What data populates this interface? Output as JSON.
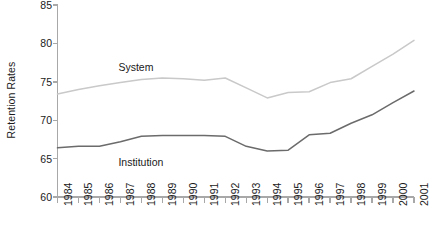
{
  "chart_data": {
    "type": "line",
    "title": "",
    "xlabel": "",
    "ylabel": "Retention Rates",
    "ylim": [
      60,
      85
    ],
    "yticks": [
      60,
      65,
      70,
      75,
      80,
      85
    ],
    "grid": false,
    "legend_position": "inline-labels",
    "categories": [
      "1984",
      "1985",
      "1986",
      "1987",
      "1988",
      "1989",
      "1990",
      "1991",
      "1992",
      "1993",
      "1994",
      "1995",
      "1996",
      "1997",
      "1998",
      "1999",
      "2000",
      "2001"
    ],
    "series": [
      {
        "name": "System",
        "color": "#c9c9c9",
        "values": [
          73.4,
          74.0,
          74.5,
          74.9,
          75.3,
          75.5,
          75.4,
          75.2,
          75.5,
          74.2,
          72.9,
          73.6,
          73.7,
          74.9,
          75.4,
          77.0,
          78.6,
          80.4
        ]
      },
      {
        "name": "Institution",
        "color": "#6b6b6b",
        "values": [
          66.4,
          66.6,
          66.6,
          67.2,
          67.9,
          68.0,
          68.0,
          68.0,
          67.9,
          66.6,
          66.0,
          66.1,
          68.1,
          68.3,
          69.6,
          70.7,
          72.3,
          73.8
        ]
      }
    ],
    "series_label_annotations": [
      {
        "text": "System",
        "x_category": "1987",
        "y_value": 76.8
      },
      {
        "text": "Institution",
        "x_category": "1987",
        "y_value": 64.4
      }
    ],
    "axis_color": "#a8a8a8"
  }
}
